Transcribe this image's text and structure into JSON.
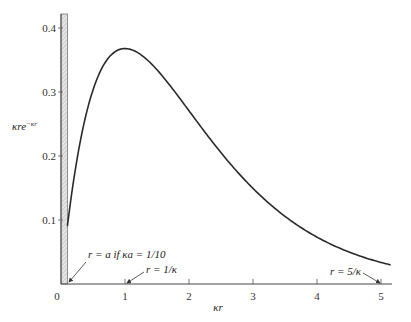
{
  "chart_data": {
    "type": "line",
    "title": "",
    "xlabel": "κr",
    "ylabel": "κre^{−κr}",
    "ylabel_parts": {
      "base": "κre",
      "sup": "−κr"
    },
    "xlim": [
      0,
      5.15
    ],
    "ylim": [
      0,
      0.42
    ],
    "grid": false,
    "legend": null,
    "x_ticks": [
      "0",
      "1",
      "2",
      "3",
      "4",
      "5"
    ],
    "y_ticks": [
      "0.1",
      "0.2",
      "0.3",
      "0.4"
    ],
    "function": "y = x * exp(-x)",
    "series": [
      {
        "name": "κre^{−κr}",
        "x": [
          0.1,
          0.2,
          0.3,
          0.4,
          0.5,
          0.6,
          0.7,
          0.8,
          0.9,
          1.0,
          1.2,
          1.4,
          1.6,
          1.8,
          2.0,
          2.25,
          2.5,
          2.75,
          3.0,
          3.25,
          3.5,
          3.75,
          4.0,
          4.25,
          4.5,
          4.75,
          5.0,
          5.15
        ],
        "values": [
          0.0905,
          0.1637,
          0.2222,
          0.2681,
          0.3033,
          0.3293,
          0.3476,
          0.3595,
          0.3659,
          0.3679,
          0.3614,
          0.3452,
          0.323,
          0.2975,
          0.2707,
          0.2371,
          0.2052,
          0.1757,
          0.1494,
          0.1259,
          0.1057,
          0.0882,
          0.0733,
          0.0606,
          0.05,
          0.0412,
          0.0337,
          0.0299
        ]
      }
    ],
    "shaded_region": {
      "x_from": 0,
      "x_to": 0.1,
      "style": "hatched",
      "meaning": "excluded region r < a"
    },
    "annotations": [
      {
        "text": "r = a  if  κa = 1/10",
        "points_to_x": 0.1
      },
      {
        "text": "r = 1/κ",
        "points_to_x": 1
      },
      {
        "text": "r = 5/κ",
        "points_to_x": 5
      }
    ]
  },
  "labels": {
    "xlabel": "κr",
    "ylabel_base": "κre",
    "ylabel_sup": "−κr",
    "origin": "0",
    "ann_a": "r = a  if  κa = 1/10",
    "ann_1": "r = 1/κ",
    "ann_5": "r = 5/κ"
  }
}
